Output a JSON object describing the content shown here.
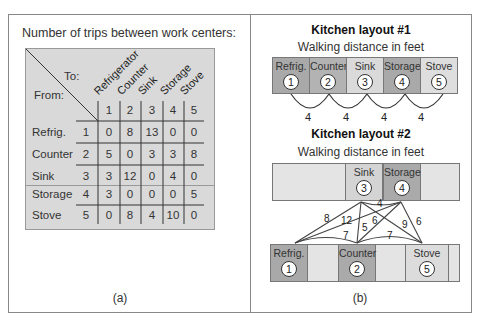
{
  "panel_a": {
    "title": "Number of trips between work centers:",
    "to_label": "To:",
    "from_label": "From:",
    "column_names": [
      "Refrigerator",
      "Counter",
      "Sink",
      "Storage",
      "Stove"
    ],
    "column_numbers": [
      "1",
      "2",
      "3",
      "4",
      "5"
    ],
    "rows": [
      {
        "name": "Refrig.",
        "num": "1",
        "values": [
          "0",
          "8",
          "13",
          "0",
          "0"
        ]
      },
      {
        "name": "Counter",
        "num": "2",
        "values": [
          "5",
          "0",
          "3",
          "3",
          "8"
        ]
      },
      {
        "name": "Sink",
        "num": "3",
        "values": [
          "3",
          "12",
          "0",
          "4",
          "0"
        ]
      },
      {
        "name": "Storage",
        "num": "4",
        "values": [
          "3",
          "0",
          "0",
          "0",
          "5"
        ]
      },
      {
        "name": "Stove",
        "num": "5",
        "values": [
          "0",
          "8",
          "4",
          "10",
          "0"
        ]
      }
    ],
    "caption": "(a)"
  },
  "panel_b": {
    "layout1": {
      "title": "Kitchen layout #1",
      "subtitle": "Walking distance in feet",
      "stations": [
        {
          "label": "Refrig.",
          "num": "1",
          "color": "#a9a9a9"
        },
        {
          "label": "Counter",
          "num": "2",
          "color": "#b3b3b3"
        },
        {
          "label": "Sink",
          "num": "3",
          "color": "#d9d9d9"
        },
        {
          "label": "Storage",
          "num": "4",
          "color": "#a9a9a9"
        },
        {
          "label": "Stove",
          "num": "5",
          "color": "#dcdcdc"
        }
      ],
      "distances": [
        "4",
        "4",
        "4",
        "4"
      ]
    },
    "layout2": {
      "title": "Kitchen layout #2",
      "subtitle": "Walking distance in feet",
      "top_stations": [
        {
          "label": "Sink",
          "num": "3"
        },
        {
          "label": "Storage",
          "num": "4"
        }
      ],
      "bottom_stations": [
        {
          "label": "Refrig.",
          "num": "1"
        },
        {
          "label": "Counter",
          "num": "2"
        },
        {
          "label": "Stove",
          "num": "5"
        }
      ],
      "distance_labels": {
        "sink_storage": "4",
        "sink_refrig": "8",
        "storage_refrig": "12",
        "refrig_counter": "7",
        "sink_counter": "5",
        "storage_counter": "6",
        "counter_stove": "7",
        "sink_stove": "9",
        "storage_stove": "6"
      }
    },
    "caption": "(b)"
  }
}
